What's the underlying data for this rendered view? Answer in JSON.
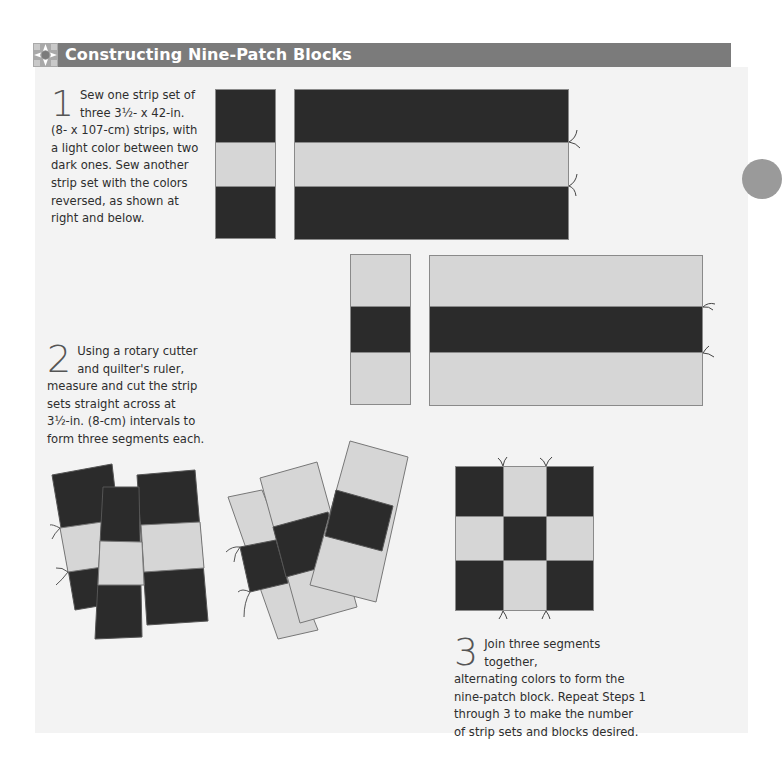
{
  "header": {
    "title": "Constructing Nine-Patch Blocks",
    "icon": "nine-patch-star-icon",
    "bar_color": "#7b7b7b"
  },
  "steps": [
    {
      "number": "1",
      "text": "Sew one strip set of three 3½- x 42-in. (8- x 107-cm) strips, with a light color between two dark ones. Sew another strip set with the colors reversed, as shown at right and below.",
      "lines": [
        "Sew one strip set of",
        "three 3½- x 42-in.",
        "(8- x 107-cm) strips, with",
        "a light color between two",
        "dark ones. Sew another",
        "strip set with the colors",
        "reversed, as shown at",
        "right and below."
      ]
    },
    {
      "number": "2",
      "text": "Using a rotary cutter and quilter's ruler, measure and cut the strip sets straight across at 3½-in. (8-cm) intervals to form three segments each.",
      "lines": [
        "Using a rotary cutter",
        "and quilter's ruler,",
        "measure and cut the strip",
        "sets straight across at",
        "3½-in. (8-cm) intervals to",
        "form three segments each."
      ]
    },
    {
      "number": "3",
      "text": "Join three segments together, alternating colors to form the nine-patch block. Repeat Steps 1 through 3 to make the number of strip sets and blocks desired.",
      "lines": [
        "Join three segments together,",
        "alternating colors to form the",
        "nine-patch block. Repeat Steps 1",
        "through 3 to make the number",
        "of strip sets and blocks desired."
      ]
    }
  ],
  "colors": {
    "dark_fabric": "#2b2b2b",
    "light_fabric": "#d6d6d6",
    "panel_bg": "#f3f3f3"
  },
  "diagrams": {
    "strip_set_dark_light_dark": [
      "dark",
      "light",
      "dark"
    ],
    "strip_set_light_dark_light": [
      "light",
      "dark",
      "light"
    ],
    "nine_patch_grid": [
      [
        "dark",
        "light",
        "dark"
      ],
      [
        "light",
        "dark",
        "light"
      ],
      [
        "dark",
        "light",
        "dark"
      ]
    ]
  }
}
